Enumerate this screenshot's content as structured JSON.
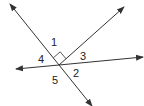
{
  "diagram": {
    "colors": {
      "line": "#333333",
      "label": "#222222",
      "background": "#ffffff"
    },
    "intersection": {
      "x": 59,
      "y": 65
    },
    "lines": [
      {
        "id": "line-a",
        "from": [
          10,
          4
        ],
        "to": [
          92,
          106
        ],
        "arrows": "both"
      },
      {
        "id": "line-b",
        "from": [
          16,
          69
        ],
        "to": [
          143,
          57
        ],
        "arrows": "both"
      },
      {
        "id": "ray-c",
        "from": [
          59,
          65
        ],
        "to": [
          124,
          7
        ],
        "arrows": "end"
      }
    ],
    "right_angle_marker": {
      "between": [
        "line-a",
        "ray-c"
      ],
      "angle_label": "1"
    },
    "labels": [
      {
        "text": "1",
        "x": 51,
        "y": 46
      },
      {
        "text": "3",
        "x": 80,
        "y": 60
      },
      {
        "text": "4",
        "x": 38,
        "y": 63
      },
      {
        "text": "2",
        "x": 73,
        "y": 77
      },
      {
        "text": "5",
        "x": 52,
        "y": 84
      }
    ]
  }
}
